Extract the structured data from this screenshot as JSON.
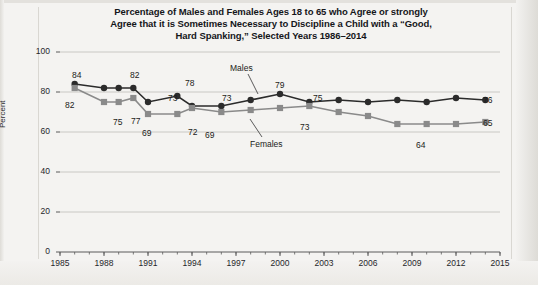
{
  "title_lines": [
    "Percentage of Males and Females Ages 18 to 65 who Agree or strongly",
    "Agree that it is Sometimes Necessary to Discipline a Child with a “Good,",
    "Hard Spanking,” Selected Years 1986–2014"
  ],
  "colors": {
    "males": "#2b2b2b",
    "females": "#8a8a8a",
    "grid": "#c9c8c4",
    "axis": "#5a5a5a",
    "background": "#f4f3f1",
    "text": "#1b1c20"
  },
  "chart_data": {
    "type": "line",
    "title": "Percentage of Males and Females Ages 18 to 65 who Agree or strongly Agree that it is Sometimes Necessary to Discipline a Child with a “Good, Hard Spanking,” Selected Years 1986–2014",
    "xlabel": "",
    "ylabel": "Percent",
    "xlim": [
      1985,
      2015
    ],
    "ylim": [
      0,
      100
    ],
    "ytick_labels": [
      "0",
      "20",
      "40",
      "60",
      "80",
      "100"
    ],
    "ytick_values": [
      0,
      20,
      40,
      60,
      80,
      100
    ],
    "xtick_labels": [
      "1985",
      "1988",
      "1991",
      "1994",
      "1997",
      "2000",
      "2003",
      "2006",
      "2009",
      "2012",
      "2015"
    ],
    "xtick_values": [
      1985,
      1988,
      1991,
      1994,
      1997,
      2000,
      2003,
      2006,
      2009,
      2012,
      2015
    ],
    "grid": "horizontal",
    "legend": "inline-series-labels",
    "series": [
      {
        "name": "Males",
        "color": "#2b2b2b",
        "marker": "circle",
        "x": [
          1986,
          1988,
          1989,
          1990,
          1991,
          1993,
          1994,
          1996,
          1998,
          2000,
          2002,
          2004,
          2006,
          2008,
          2010,
          2012,
          2014
        ],
        "values": [
          84,
          82,
          82,
          82,
          75,
          78,
          73,
          73,
          76,
          79,
          75,
          76,
          75,
          76,
          75,
          77,
          76
        ]
      },
      {
        "name": "Females",
        "color": "#8a8a8a",
        "marker": "square",
        "x": [
          1986,
          1988,
          1989,
          1990,
          1991,
          1993,
          1994,
          1996,
          1998,
          2000,
          2002,
          2004,
          2006,
          2008,
          2010,
          2012,
          2014
        ],
        "values": [
          82,
          75,
          75,
          77,
          69,
          69,
          72,
          70,
          71,
          72,
          73,
          70,
          68,
          64,
          64,
          64,
          65
        ]
      }
    ],
    "point_labels": [
      {
        "text": "84",
        "series": "Males",
        "x": 1986,
        "value": 84,
        "px": 72,
        "py": 70
      },
      {
        "text": "82",
        "series": "Females",
        "x": 1986,
        "value": 82,
        "px": 65,
        "py": 100
      },
      {
        "text": "82",
        "series": "Males",
        "x": 1990,
        "value": 82,
        "px": 130,
        "py": 70
      },
      {
        "text": "75",
        "series": "Females",
        "x": 1989,
        "value": 75,
        "px": 113,
        "py": 117
      },
      {
        "text": "77",
        "series": "Females",
        "x": 1990,
        "value": 77,
        "px": 131,
        "py": 116
      },
      {
        "text": "69",
        "series": "Females",
        "x": 1991,
        "value": 69,
        "px": 142,
        "py": 128
      },
      {
        "text": "78",
        "series": "Males",
        "x": 1993,
        "value": 78,
        "px": 185,
        "py": 78
      },
      {
        "text": "73",
        "series": "Males",
        "x": 1994,
        "value": 73,
        "px": 168,
        "py": 93
      },
      {
        "text": "72",
        "series": "Females",
        "x": 1994,
        "value": 72,
        "px": 188,
        "py": 127
      },
      {
        "text": "69",
        "series": "Females",
        "x": 1993,
        "value": 69,
        "px": 205,
        "py": 130
      },
      {
        "text": "73",
        "series": "Males",
        "x": 1996,
        "value": 73,
        "px": 222,
        "py": 93
      },
      {
        "text": "79",
        "series": "Males",
        "x": 2000,
        "value": 79,
        "px": 275,
        "py": 80
      },
      {
        "text": "75",
        "series": "Males",
        "x": 2002,
        "value": 75,
        "px": 313,
        "py": 93
      },
      {
        "text": "73",
        "series": "Females",
        "x": 2002,
        "value": 73,
        "px": 300,
        "py": 122
      },
      {
        "text": "64",
        "series": "Females",
        "x": 2010,
        "value": 64,
        "px": 416,
        "py": 140
      },
      {
        "text": "76",
        "series": "Males",
        "x": 2014,
        "value": 76,
        "px": 483,
        "py": 95
      },
      {
        "text": "65",
        "series": "Females",
        "x": 2014,
        "value": 65,
        "px": 483,
        "py": 118
      }
    ],
    "series_annotations": [
      {
        "text": "Males",
        "px": 230,
        "py": 63
      },
      {
        "text": "Females",
        "px": 250,
        "py": 139
      }
    ]
  }
}
